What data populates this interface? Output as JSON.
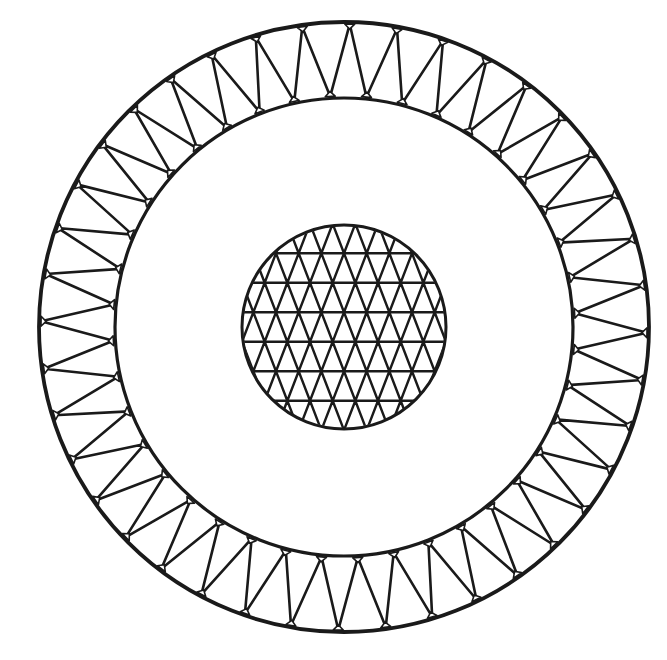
{
  "diagram": {
    "type": "cable-cross-section",
    "background_color": "#ffffff",
    "line_color": "#1a1a1a",
    "center": [
      344,
      327
    ],
    "outer_layer": {
      "outer_radius": 305,
      "inner_radius": 229,
      "segment_count": 40,
      "stroke_width": 3.2,
      "strand_shape": "alternating-rounded-triangles"
    },
    "core": {
      "radius": 102,
      "band_count": 6,
      "band_spacing": 29.5,
      "cells_per_band_row": 9,
      "stroke_width": 2.6,
      "strand_shape": "triangular-lattice"
    },
    "labels": []
  }
}
